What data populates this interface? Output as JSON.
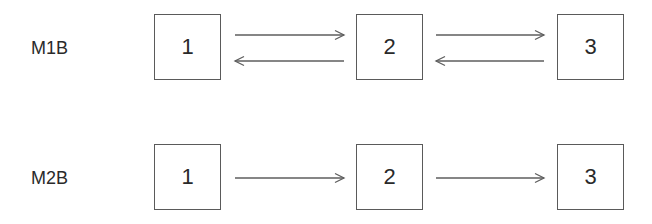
{
  "diagram": {
    "rows": [
      {
        "label": "M1B",
        "label_x": 31,
        "label_y": 39,
        "box_top": 14,
        "states": [
          {
            "label": "1",
            "x": 154
          },
          {
            "label": "2",
            "x": 356
          },
          {
            "label": "3",
            "x": 557
          }
        ],
        "transitions": [
          {
            "from": "1",
            "to": "2",
            "direction": "forward",
            "x1": 235,
            "x2": 344,
            "y": 35
          },
          {
            "from": "2",
            "to": "1",
            "direction": "backward",
            "x1": 235,
            "x2": 344,
            "y": 61
          },
          {
            "from": "2",
            "to": "3",
            "direction": "forward",
            "x1": 436,
            "x2": 544,
            "y": 35
          },
          {
            "from": "3",
            "to": "2",
            "direction": "backward",
            "x1": 436,
            "x2": 544,
            "y": 61
          }
        ]
      },
      {
        "label": "M2B",
        "label_x": 31,
        "label_y": 169,
        "box_top": 144,
        "states": [
          {
            "label": "1",
            "x": 154
          },
          {
            "label": "2",
            "x": 356
          },
          {
            "label": "3",
            "x": 557
          }
        ],
        "transitions": [
          {
            "from": "1",
            "to": "2",
            "direction": "forward",
            "x1": 235,
            "x2": 344,
            "y": 178
          },
          {
            "from": "2",
            "to": "3",
            "direction": "forward",
            "x1": 436,
            "x2": 544,
            "y": 178
          }
        ]
      }
    ],
    "box_size": 67,
    "colors": {
      "stroke": "#5e5e5e",
      "text": "#2a2a2a",
      "background": "#ffffff"
    }
  }
}
